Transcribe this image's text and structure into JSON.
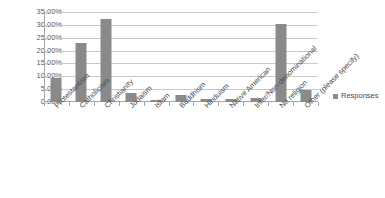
{
  "chart_data": {
    "type": "bar",
    "title": "",
    "xlabel": "",
    "ylabel": "",
    "ylim": [
      0,
      35
    ],
    "ytick_labels": [
      "35.00%",
      "30.00%",
      "25.00%",
      "20.00%",
      "15.00%",
      "10.00%",
      "5.00%",
      "0.00%"
    ],
    "ytick_values": [
      35,
      30,
      25,
      20,
      15,
      10,
      5,
      0
    ],
    "grid": true,
    "legend_position": "right",
    "categories": [
      "Protestantism",
      "Catholicism",
      "Christianity",
      "Judaism",
      "Islam",
      "Buddhism",
      "Hinduism",
      "Native American",
      "Inter/Non-denominational",
      "No religion",
      "Other (please specify)"
    ],
    "series": [
      {
        "name": "Responses",
        "color": "#8a8a8a",
        "values": [
          9.2,
          23.0,
          32.3,
          3.5,
          0.8,
          2.8,
          1.0,
          1.0,
          1.5,
          30.3,
          4.6
        ]
      }
    ]
  },
  "legend": {
    "entries": [
      {
        "label": "Responses",
        "color": "#8a8a8a"
      }
    ]
  }
}
